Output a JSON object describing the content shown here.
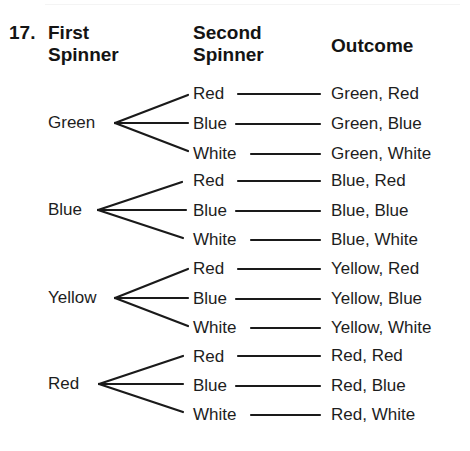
{
  "problem_number": "17.",
  "headers": {
    "first": [
      "First",
      "Spinner"
    ],
    "second": [
      "Second",
      "Spinner"
    ],
    "outcome": "Outcome"
  },
  "groups": [
    {
      "first": "Green",
      "branches": [
        {
          "second": "Red",
          "outcome": "Green, Red"
        },
        {
          "second": "Blue",
          "outcome": "Green, Blue"
        },
        {
          "second": "White",
          "outcome": "Green, White"
        }
      ]
    },
    {
      "first": "Blue",
      "branches": [
        {
          "second": "Red",
          "outcome": "Blue, Red"
        },
        {
          "second": "Blue",
          "outcome": "Blue, Blue"
        },
        {
          "second": "White",
          "outcome": "Blue, White"
        }
      ]
    },
    {
      "first": "Yellow",
      "branches": [
        {
          "second": "Red",
          "outcome": "Yellow, Red"
        },
        {
          "second": "Blue",
          "outcome": "Yellow, Blue"
        },
        {
          "second": "White",
          "outcome": "Yellow, White"
        }
      ]
    },
    {
      "first": "Red",
      "branches": [
        {
          "second": "Red",
          "outcome": "Red, Red"
        },
        {
          "second": "Blue",
          "outcome": "Red, Blue"
        },
        {
          "second": "White",
          "outcome": "Red, White"
        }
      ]
    }
  ],
  "colors": {
    "ink": "#1a1a1a",
    "background": "#ffffff"
  }
}
